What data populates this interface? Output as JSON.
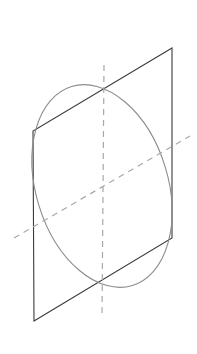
{
  "figure": {
    "title": "Circle inscribed in a plane shown in oblique projection",
    "canvas": {
      "width": 197,
      "height": 354,
      "background": "#ffffff"
    },
    "colors": {
      "plane_stroke": "#3b3b3b",
      "ellipse_stroke": "#8c8c8c",
      "axis_stroke": "#a8a8a8",
      "background": "#ffffff"
    },
    "strokes": {
      "plane_width": 1.1,
      "ellipse_width": 1.1,
      "axis_width": 1.2,
      "axis_dash": "6 5"
    },
    "shapes": {
      "plane": {
        "name": "parallelogram-plane",
        "points": "172,48 33,131 34,321 172,238",
        "vertices": [
          {
            "label": "top-right",
            "x": 172,
            "y": 48
          },
          {
            "label": "top-left",
            "x": 33,
            "y": 131
          },
          {
            "label": "bottom-left",
            "x": 34,
            "y": 321
          },
          {
            "label": "bottom-right",
            "x": 172,
            "y": 238
          }
        ]
      },
      "ellipse": {
        "name": "inscribed-ellipse",
        "cx": 102,
        "cy": 186,
        "rx": 66,
        "ry": 104,
        "rotation_deg": -17
      },
      "vertical_axis": {
        "name": "vertical-dashed-axis",
        "x1": 104,
        "y1": 65,
        "x2": 102,
        "y2": 318
      },
      "oblique_axis": {
        "name": "oblique-dashed-axis",
        "x1": 14,
        "y1": 238,
        "x2": 190,
        "y2": 136
      }
    }
  }
}
